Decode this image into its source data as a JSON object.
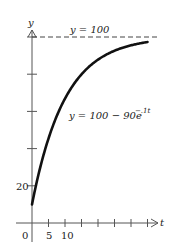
{
  "chart_data": {
    "type": "line",
    "title": "",
    "xlabel": "t",
    "ylabel": "y",
    "x_tick_labels": [
      "0",
      "5",
      "10"
    ],
    "x_ticks": [
      0,
      5,
      10,
      15,
      20,
      25,
      30,
      35
    ],
    "y_tick_labels": [
      "20"
    ],
    "y_ticks": [
      20,
      40,
      60,
      80,
      100
    ],
    "xlim": [
      0,
      38
    ],
    "ylim": [
      0,
      105
    ],
    "grid": false,
    "legend": null,
    "series": [
      {
        "name": "y = 100 − 90e^(−.1t)",
        "formula": "100 - 90*exp(-0.1*t)",
        "x": [
          0,
          2.5,
          5,
          7.5,
          10,
          12.5,
          15,
          17.5,
          20,
          22.5,
          25,
          27.5,
          30,
          32.5,
          35
        ],
        "values": [
          10,
          29.9,
          45.4,
          57.5,
          66.9,
          74.2,
          79.9,
          84.4,
          87.8,
          90.5,
          92.6,
          94.3,
          95.5,
          96.5,
          97.3
        ]
      }
    ],
    "annotations": [
      {
        "text": "y = 100",
        "type": "horizontal-asymptote",
        "value": 100,
        "style": "dashed"
      },
      {
        "text": "y = 100 − 90e",
        "exponent": "−.1t",
        "position": "below curve, right side"
      }
    ]
  },
  "labels": {
    "y_axis": "y",
    "t_axis": "t",
    "origin": "0",
    "t5": "5",
    "t10": "10",
    "y20": "20",
    "asymptote": "y = 100",
    "curve_eq_base": "y = 100 − 90e",
    "curve_eq_exp": "−.1t"
  }
}
